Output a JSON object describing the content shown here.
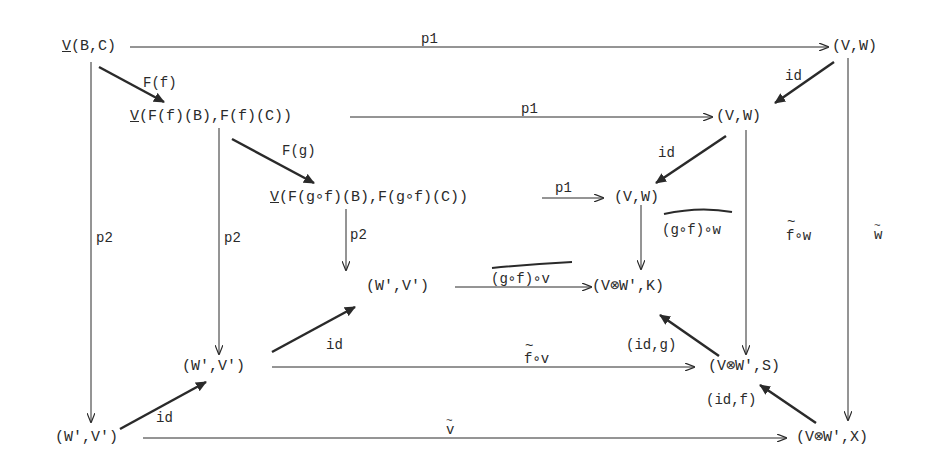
{
  "diagram": {
    "type": "commutative-diagram",
    "nodes": {
      "VBC": {
        "prefix": "V",
        "text": "(B,C)"
      },
      "VW_top": {
        "text": "(V,W)"
      },
      "VFf": {
        "prefix": "V",
        "text": "(F(f)(B),F(f)(C))"
      },
      "VW_mid": {
        "text": "(V,W)"
      },
      "VFgf": {
        "prefix": "V",
        "text": "(F(g∘f)(B),F(g∘f)(C))"
      },
      "VW_inner": {
        "text": "(V,W)"
      },
      "WV_inner": {
        "text": "(W',V')"
      },
      "VWK": {
        "text": "(V⊗W',K)"
      },
      "WV_mid": {
        "text": "(W',V')"
      },
      "VWS": {
        "text": "(V⊗W',S)"
      },
      "WV_outer": {
        "text": "(W',V')"
      },
      "VWX": {
        "text": "(V⊗W',X)"
      }
    },
    "edges": {
      "top_p1": "p1",
      "mid_p1": "p1",
      "inner_p1": "p1",
      "Ff": "F(f)",
      "Fg": "F(g)",
      "id_top_right": "id",
      "id_mid_right": "id",
      "outer_p2": "p2",
      "mid_p2": "p2",
      "inner_p2": "p2",
      "gfw": "(g∘f)∘w",
      "fw": "f∘w",
      "w_tilde": "w",
      "gfv": "(g∘f)∘v",
      "fv": "f∘v",
      "v_tilde": "v",
      "id_inner_left": "id",
      "id_outer_left": "id",
      "idg": "(id,g)",
      "idf": "(id,f)",
      "tilde": "~"
    }
  }
}
